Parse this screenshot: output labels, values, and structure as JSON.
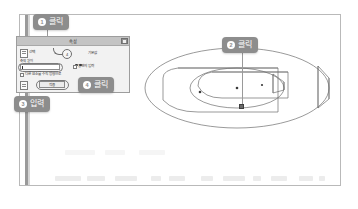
{
  "document": {
    "title_visible": false
  },
  "dialog": {
    "title": "속성",
    "close_label": "×",
    "tab_label": "선택",
    "secondary_label": "기본값",
    "field_label": "축의 길이",
    "field_value": "",
    "field_placeholder": "",
    "checkbox_1_label": "양면의 입력",
    "checkbox_2_label": "다른 요소를 수직 방향으로",
    "ok_label": "적용",
    "inline_marker": "4"
  },
  "callouts": [
    {
      "id": 1,
      "num": "1",
      "label": "클릭",
      "name": "callout-click-1"
    },
    {
      "id": 2,
      "num": "2",
      "label": "클릭",
      "name": "callout-click-2"
    },
    {
      "id": 3,
      "num": "3",
      "label": "입력",
      "name": "callout-input-3"
    },
    {
      "id": 4,
      "num": "4",
      "label": "클릭",
      "name": "callout-click-4"
    }
  ],
  "model": {
    "description": "3D 환형 솔리드 (annular ring with cut-away wedge)",
    "point_marker_label": "",
    "center_points": 3
  },
  "colors": {
    "badge_bg": "#8d8d8d",
    "badge_text": "#ffffff",
    "frame_border": "#b9b9b9",
    "dialog_titlebar": "#c4c4c4",
    "dialog_bg": "#f2f2f2",
    "model_stroke": "#6f6f6f",
    "leader_line": "#9a9a9a"
  }
}
